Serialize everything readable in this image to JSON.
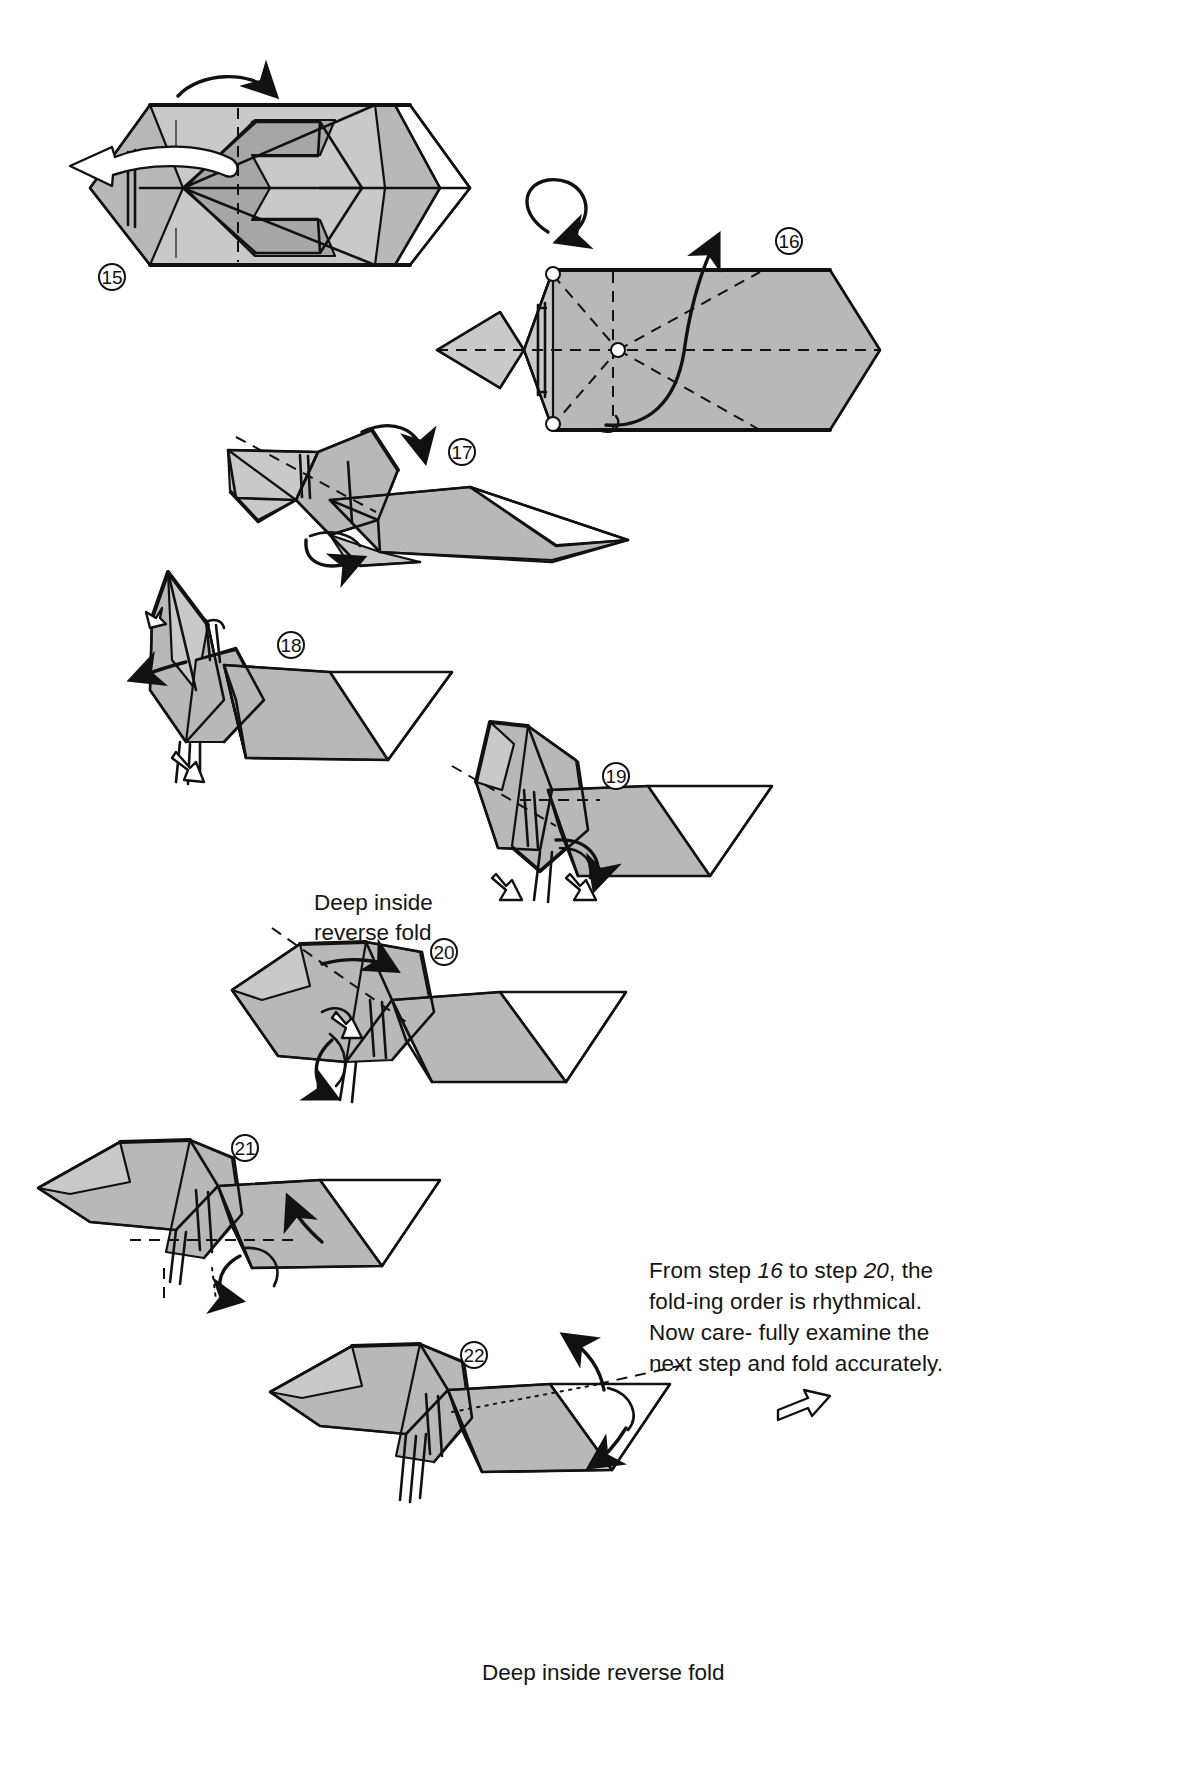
{
  "page": {
    "kind": "origami-diagram-page",
    "width": 1199,
    "height": 1780,
    "background_color": "#ffffff",
    "paper_color": "#b8b8b8",
    "line_color": "#111111"
  },
  "steps": [
    {
      "number": "15",
      "label_x": 112,
      "label_y": 277
    },
    {
      "number": "16",
      "label_x": 789,
      "label_y": 241
    },
    {
      "number": "17",
      "label_x": 462,
      "label_y": 452
    },
    {
      "number": "18",
      "label_x": 291,
      "label_y": 645
    },
    {
      "number": "19",
      "label_x": 616,
      "label_y": 776
    },
    {
      "number": "20",
      "label_x": 444,
      "label_y": 952
    },
    {
      "number": "21",
      "label_x": 245,
      "label_y": 1148
    },
    {
      "number": "22",
      "label_x": 474,
      "label_y": 1355
    }
  ],
  "captions": {
    "deep_inside_reverse_fold_left": "Deep inside\nreverse fold",
    "deep_inside_reverse_fold_bottom": "Deep inside reverse fold"
  },
  "note": {
    "line1_a": "From step ",
    "line1_num1": "16",
    "line1_b": " to step ",
    "line1_num2": "20",
    "line1_c": ", the fold-",
    "line2": "ing order is rhythmical. Now care-",
    "line3": "fully examine the next step and",
    "line4": "fold accurately.",
    "full_text": "From step 16 to step 20, the folding order is rhythmical. Now carefully examine the next step and fold accurately."
  },
  "symbols": {
    "turn_over_arrow": "turn-over-rotation-arrow",
    "continue_arrow": "continue-to-next-page-arrow",
    "fold_arrow": "fold-direction-arrow",
    "push_in_arrow": "hollow-push-arrow"
  }
}
